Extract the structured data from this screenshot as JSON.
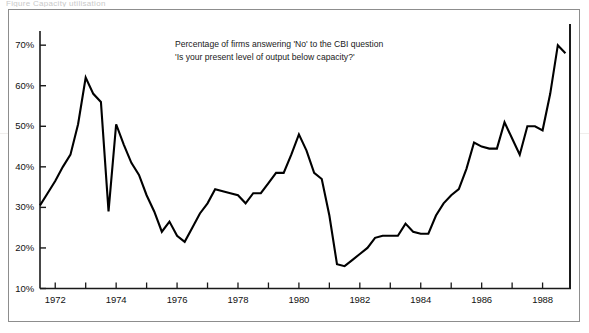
{
  "caption_sliver": "Figure  Capacity utilisation",
  "chart_data": {
    "type": "line",
    "title": "",
    "annotation_lines": [
      "Percentage of firms answering 'No' to the CBI question",
      "'Is your present level of output below capacity?'"
    ],
    "xlabel": "",
    "ylabel": "",
    "xlim": [
      1971.5,
      1988.9
    ],
    "ylim": [
      10,
      73
    ],
    "grid": false,
    "legend": "none",
    "line_color": "#000000",
    "axis_color": "#1a1a1a",
    "ytick_labels": [
      "70%",
      "60%",
      "50%",
      "40%",
      "30%",
      "20%",
      "10%"
    ],
    "ytick_values": [
      70,
      60,
      50,
      40,
      30,
      20,
      10
    ],
    "xtick_labels": [
      "1972",
      "1974",
      "1976",
      "1978",
      "1980",
      "1982",
      "1984",
      "1986",
      "1988"
    ],
    "xtick_values": [
      1972,
      1974,
      1976,
      1978,
      1980,
      1982,
      1984,
      1986,
      1988
    ],
    "xminor_values": [
      1973,
      1975,
      1977,
      1979,
      1981,
      1983,
      1985,
      1987
    ],
    "x": [
      1971.5,
      1971.75,
      1972.0,
      1972.25,
      1972.5,
      1972.75,
      1973.0,
      1973.25,
      1973.5,
      1973.75,
      1974.0,
      1974.25,
      1974.5,
      1974.75,
      1975.0,
      1975.25,
      1975.5,
      1975.75,
      1976.0,
      1976.25,
      1976.5,
      1976.75,
      1977.0,
      1977.25,
      1977.5,
      1977.75,
      1978.0,
      1978.25,
      1978.5,
      1978.75,
      1979.0,
      1979.25,
      1979.5,
      1979.75,
      1980.0,
      1980.25,
      1980.5,
      1980.75,
      1981.0,
      1981.25,
      1981.5,
      1981.75,
      1982.0,
      1982.25,
      1982.5,
      1982.75,
      1983.0,
      1983.25,
      1983.5,
      1983.75,
      1984.0,
      1984.25,
      1984.5,
      1984.75,
      1985.0,
      1985.25,
      1985.5,
      1985.75,
      1986.0,
      1986.25,
      1986.5,
      1986.75,
      1987.0,
      1987.25,
      1987.5,
      1987.75,
      1988.0,
      1988.25,
      1988.5,
      1988.75
    ],
    "values": [
      30.5,
      33.5,
      36.5,
      40.0,
      43.0,
      50.5,
      62.0,
      58.0,
      56.0,
      29.0,
      50.5,
      45.5,
      41.0,
      38.0,
      33.0,
      29.0,
      24.0,
      26.5,
      23.0,
      21.5,
      25.0,
      28.5,
      31.0,
      34.5,
      34.0,
      33.5,
      33.0,
      31.0,
      33.5,
      33.5,
      36.0,
      38.5,
      38.5,
      43.0,
      48.0,
      44.0,
      38.5,
      37.0,
      28.0,
      16.0,
      15.5,
      17.0,
      18.5,
      20.0,
      22.5,
      23.0,
      23.0,
      23.0,
      26.0,
      24.0,
      23.5,
      23.5,
      28.0,
      31.0,
      33.0,
      34.5,
      39.5,
      46.0,
      45.0,
      44.5,
      44.5,
      51.0,
      47.0,
      43.0,
      50.0,
      50.0,
      49.0,
      58.0,
      70.0,
      68.0
    ]
  }
}
